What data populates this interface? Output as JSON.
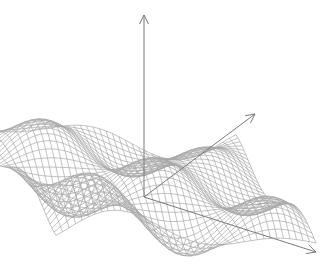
{
  "chart_data": {
    "type": "surface-wireframe",
    "title": "",
    "xlabel": "",
    "ylabel": "",
    "zlabel": "",
    "function": "z = a*sin(x)*cos(y) style undulating surface",
    "grid": {
      "u_lines": 40,
      "v_lines": 40
    },
    "domain": {
      "x": [
        -1,
        1
      ],
      "y": [
        -1,
        1
      ]
    },
    "wave": {
      "kx": 1.5,
      "ky": 1.5,
      "amplitude": 0.22,
      "phase_x": 0.0,
      "phase_y": 0.5
    },
    "projection": {
      "origin_px": [
        144,
        197
      ],
      "x_axis_vec_px": [
        120,
        44
      ],
      "y_axis_vec_px": [
        95,
        -62
      ],
      "z_axis_vec_px": [
        0,
        -170
      ]
    },
    "axes": {
      "x_end_px": [
        316,
        252
      ],
      "y_end_px": [
        255,
        114
      ],
      "z_end_px": [
        144,
        15
      ],
      "arrowheads": true
    },
    "colors": {
      "mesh": "#a8a8a8",
      "axis": "#7a7a7a",
      "background": "#ffffff"
    },
    "legend": null,
    "ticks": []
  }
}
